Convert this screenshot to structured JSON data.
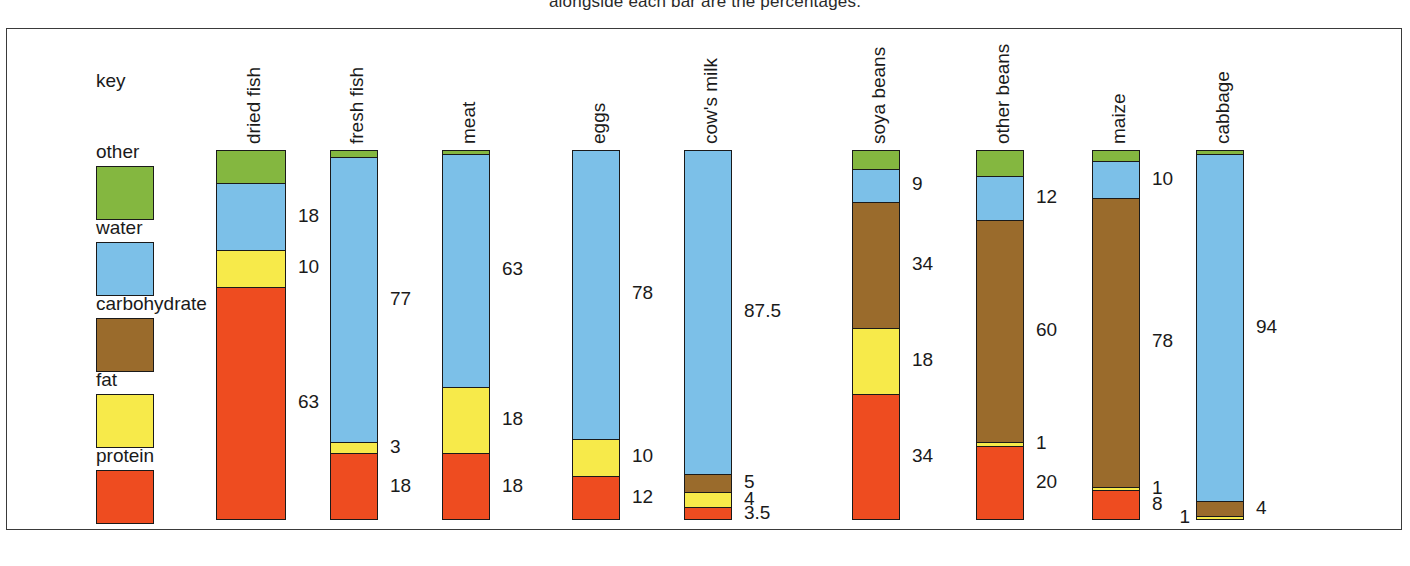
{
  "caption": "alongside each bar are the percentages.",
  "key": {
    "title": "key",
    "items": [
      {
        "label": "other",
        "color": "#84b740"
      },
      {
        "label": "water",
        "color": "#7cc0e8"
      },
      {
        "label": "carbohydrate",
        "color": "#9a6b2c"
      },
      {
        "label": "fat",
        "color": "#f7ea4a"
      },
      {
        "label": "protein",
        "color": "#ee4c20"
      }
    ]
  },
  "chart_data": {
    "type": "bar",
    "subtype": "stacked-bar-100",
    "title": "",
    "xlabel": "",
    "ylabel": "",
    "ylim": [
      0,
      100
    ],
    "grid": false,
    "legend_position": "left",
    "categories": [
      "dried fish",
      "fresh fish",
      "meat",
      "eggs",
      "cow's milk",
      "soya beans",
      "other beans",
      "maize",
      "cabbage"
    ],
    "series": [
      {
        "name": "other",
        "color": "#84b740",
        "values": [
          9,
          2,
          1,
          0,
          0,
          5,
          7,
          3,
          1
        ]
      },
      {
        "name": "water",
        "color": "#7cc0e8",
        "values": [
          18,
          77,
          63,
          78,
          87.5,
          9,
          12,
          10,
          94
        ]
      },
      {
        "name": "carbohydrate",
        "color": "#9a6b2c",
        "values": [
          0,
          0,
          0,
          0,
          5,
          34,
          60,
          78,
          4
        ]
      },
      {
        "name": "fat",
        "color": "#f7ea4a",
        "values": [
          10,
          3,
          18,
          10,
          4,
          18,
          1,
          1,
          1
        ]
      },
      {
        "name": "protein",
        "color": "#ee4c20",
        "values": [
          63,
          18,
          18,
          12,
          3.5,
          34,
          20,
          8,
          0
        ]
      }
    ],
    "bars": [
      {
        "name": "dried fish",
        "x": 216,
        "width": 70,
        "segments": [
          {
            "series": "other",
            "value": 9,
            "color": "#84b740",
            "label": ""
          },
          {
            "series": "water",
            "value": 18,
            "color": "#7cc0e8",
            "label": "18"
          },
          {
            "series": "fat",
            "value": 10,
            "color": "#f7ea4a",
            "label": "10"
          },
          {
            "series": "protein",
            "value": 63,
            "color": "#ee4c20",
            "label": "63"
          }
        ]
      },
      {
        "name": "fresh fish",
        "x": 330,
        "width": 48,
        "segments": [
          {
            "series": "other",
            "value": 2,
            "color": "#84b740",
            "label": ""
          },
          {
            "series": "water",
            "value": 77,
            "color": "#7cc0e8",
            "label": "77"
          },
          {
            "series": "fat",
            "value": 3,
            "color": "#f7ea4a",
            "label": "3"
          },
          {
            "series": "protein",
            "value": 18,
            "color": "#ee4c20",
            "label": "18"
          }
        ]
      },
      {
        "name": "meat",
        "x": 442,
        "width": 48,
        "segments": [
          {
            "series": "other",
            "value": 1,
            "color": "#84b740",
            "label": ""
          },
          {
            "series": "water",
            "value": 63,
            "color": "#7cc0e8",
            "label": "63"
          },
          {
            "series": "fat",
            "value": 18,
            "color": "#f7ea4a",
            "label": "18"
          },
          {
            "series": "protein",
            "value": 18,
            "color": "#ee4c20",
            "label": "18"
          }
        ]
      },
      {
        "name": "eggs",
        "x": 572,
        "width": 48,
        "segments": [
          {
            "series": "water",
            "value": 78,
            "color": "#7cc0e8",
            "label": "78"
          },
          {
            "series": "fat",
            "value": 10,
            "color": "#f7ea4a",
            "label": "10"
          },
          {
            "series": "protein",
            "value": 12,
            "color": "#ee4c20",
            "label": "12"
          }
        ]
      },
      {
        "name": "cow's milk",
        "x": 684,
        "width": 48,
        "segments": [
          {
            "series": "water",
            "value": 87.5,
            "color": "#7cc0e8",
            "label": "87.5"
          },
          {
            "series": "carbohydrate",
            "value": 5,
            "color": "#9a6b2c",
            "label": "5"
          },
          {
            "series": "fat",
            "value": 4,
            "color": "#f7ea4a",
            "label": "4"
          },
          {
            "series": "protein",
            "value": 3.5,
            "color": "#ee4c20",
            "label": "3.5"
          }
        ]
      },
      {
        "name": "soya beans",
        "x": 852,
        "width": 48,
        "segments": [
          {
            "series": "other",
            "value": 5,
            "color": "#84b740",
            "label": ""
          },
          {
            "series": "water",
            "value": 9,
            "color": "#7cc0e8",
            "label": "9"
          },
          {
            "series": "carbohydrate",
            "value": 34,
            "color": "#9a6b2c",
            "label": "34"
          },
          {
            "series": "fat",
            "value": 18,
            "color": "#f7ea4a",
            "label": "18"
          },
          {
            "series": "protein",
            "value": 34,
            "color": "#ee4c20",
            "label": "34"
          }
        ]
      },
      {
        "name": "other beans",
        "x": 976,
        "width": 48,
        "segments": [
          {
            "series": "other",
            "value": 7,
            "color": "#84b740",
            "label": ""
          },
          {
            "series": "water",
            "value": 12,
            "color": "#7cc0e8",
            "label": "12"
          },
          {
            "series": "carbohydrate",
            "value": 60,
            "color": "#9a6b2c",
            "label": "60"
          },
          {
            "series": "fat",
            "value": 1,
            "color": "#f7ea4a",
            "label": "1"
          },
          {
            "series": "protein",
            "value": 20,
            "color": "#ee4c20",
            "label": "20"
          }
        ]
      },
      {
        "name": "maize",
        "x": 1092,
        "width": 48,
        "segments": [
          {
            "series": "other",
            "value": 3,
            "color": "#84b740",
            "label": ""
          },
          {
            "series": "water",
            "value": 10,
            "color": "#7cc0e8",
            "label": "10"
          },
          {
            "series": "carbohydrate",
            "value": 78,
            "color": "#9a6b2c",
            "label": "78"
          },
          {
            "series": "fat",
            "value": 1,
            "color": "#f7ea4a",
            "label": "1"
          },
          {
            "series": "protein",
            "value": 8,
            "color": "#ee4c20",
            "label": "8"
          }
        ]
      },
      {
        "name": "cabbage",
        "x": 1196,
        "width": 48,
        "segments": [
          {
            "series": "other",
            "value": 1,
            "color": "#84b740",
            "label": ""
          },
          {
            "series": "water",
            "value": 94,
            "color": "#7cc0e8",
            "label": "94"
          },
          {
            "series": "carbohydrate",
            "value": 4,
            "color": "#9a6b2c",
            "label": "4"
          },
          {
            "series": "fat",
            "value": 1,
            "color": "#f7ea4a",
            "label": "1",
            "label_side": "left"
          }
        ]
      }
    ]
  }
}
